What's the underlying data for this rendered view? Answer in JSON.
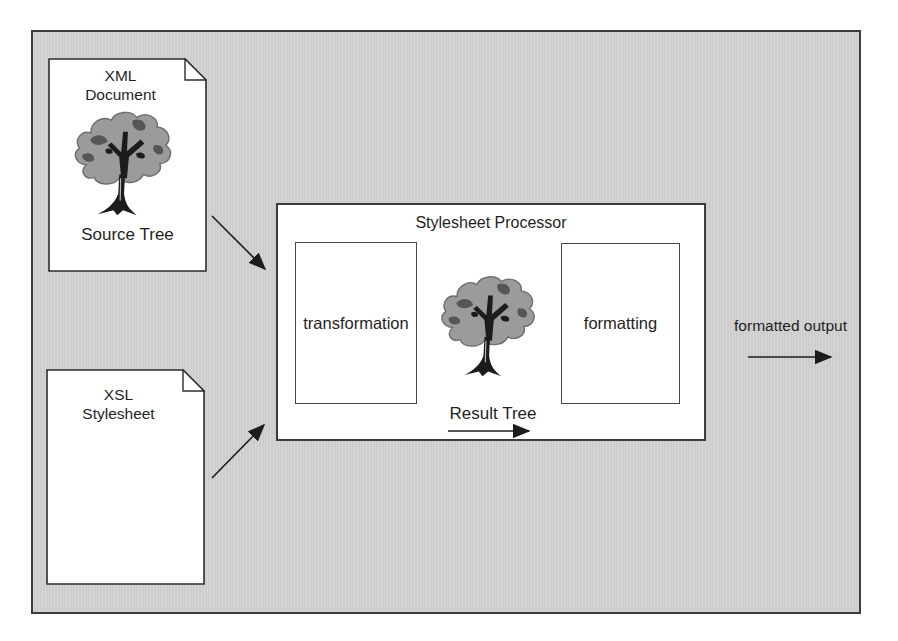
{
  "xml_document": {
    "line1": "XML",
    "line2": "Document",
    "caption": "Source Tree"
  },
  "xsl_stylesheet": {
    "line1": "XSL",
    "line2": "Stylesheet"
  },
  "processor": {
    "title": "Stylesheet Processor",
    "transformation": "transformation",
    "formatting": "formatting",
    "result_caption": "Result Tree"
  },
  "output": {
    "label": "formatted output"
  },
  "colors": {
    "diagram_bg": "#d2d2d2",
    "panel_bg": "#ffffff",
    "line": "#2e2e2e",
    "text": "#1f1f1f",
    "tree_canopy": "#9b9b9b",
    "tree_dark": "#565656",
    "tree_black": "#1c1c1c"
  }
}
